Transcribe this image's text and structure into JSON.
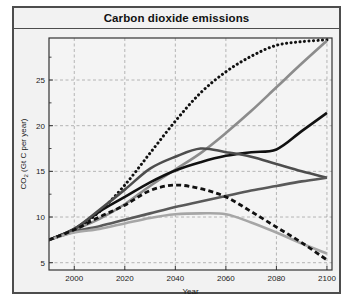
{
  "figure": {
    "title": "Carbon dioxide emissions",
    "background_color": "#f2f2f2",
    "border_color": "#4d4d4d"
  },
  "chart_data": {
    "type": "line",
    "title": "Carbon dioxide emissions",
    "xlabel": "Year",
    "ylabel": "CO2 (Gt C per year)",
    "ylabel_base": "CO",
    "ylabel_sub": "2",
    "ylabel_rest": " (Gt C per year)",
    "xlim": [
      1990,
      2102
    ],
    "ylim": [
      4.2,
      29.6
    ],
    "xticks": [
      2000,
      2020,
      2040,
      2060,
      2080,
      2100
    ],
    "xtick_labels": [
      "2000",
      "2020",
      "2040",
      "2060",
      "2080",
      "2100"
    ],
    "yticks": [
      5,
      10,
      15,
      20,
      25
    ],
    "ytick_labels": [
      "5",
      "10",
      "15",
      "20",
      "25"
    ],
    "yticks_minor": [
      7.5,
      12.5,
      17.5,
      22.5,
      27.5
    ],
    "grid": true,
    "grid_color": "#9a9a9a",
    "grid_style": "dashed",
    "legend": "none",
    "series": [
      {
        "name": "A1FI",
        "style": "dotted",
        "color": "#111111",
        "width": 2.6,
        "x": [
          1990,
          2000,
          2010,
          2020,
          2030,
          2040,
          2050,
          2060,
          2070,
          2080,
          2090,
          2100
        ],
        "values": [
          7.5,
          8.6,
          10.6,
          13.5,
          17.0,
          20.5,
          23.6,
          25.9,
          27.6,
          28.8,
          29.2,
          29.4
        ]
      },
      {
        "name": "A2",
        "style": "solid",
        "color": "#8c8c8c",
        "width": 2.6,
        "x": [
          1990,
          2000,
          2010,
          2020,
          2030,
          2040,
          2050,
          2060,
          2070,
          2080,
          2090,
          2100
        ],
        "values": [
          7.5,
          8.6,
          9.8,
          11.4,
          13.4,
          15.2,
          17.0,
          19.2,
          21.6,
          24.2,
          26.8,
          29.3
        ]
      },
      {
        "name": "A1B",
        "style": "solid",
        "color": "#111111",
        "width": 2.6,
        "x": [
          1990,
          2000,
          2010,
          2020,
          2030,
          2040,
          2050,
          2060,
          2070,
          2080,
          2090,
          2100
        ],
        "values": [
          7.5,
          8.7,
          10.6,
          12.2,
          13.8,
          15.1,
          16.0,
          16.7,
          17.1,
          17.4,
          19.4,
          21.4
        ]
      },
      {
        "name": "A1T",
        "style": "solid",
        "color": "#4d4d4d",
        "width": 2.6,
        "x": [
          1990,
          2000,
          2010,
          2020,
          2030,
          2040,
          2050,
          2060,
          2070,
          2080,
          2090,
          2100
        ],
        "values": [
          7.5,
          8.7,
          10.8,
          13.0,
          15.3,
          16.6,
          17.5,
          17.1,
          16.6,
          15.8,
          15.0,
          14.3
        ]
      },
      {
        "name": "B2",
        "style": "solid",
        "color": "#595959",
        "width": 2.6,
        "x": [
          1990,
          2000,
          2010,
          2020,
          2030,
          2040,
          2050,
          2060,
          2070,
          2080,
          2090,
          2100
        ],
        "values": [
          7.5,
          8.4,
          9.0,
          9.7,
          10.4,
          11.1,
          11.7,
          12.3,
          12.9,
          13.4,
          13.9,
          14.3
        ]
      },
      {
        "name": "B1",
        "style": "solid",
        "color": "#a6a6a6",
        "width": 2.6,
        "x": [
          1990,
          2000,
          2010,
          2020,
          2030,
          2040,
          2050,
          2060,
          2070,
          2080,
          2090,
          2100
        ],
        "values": [
          7.5,
          8.3,
          8.7,
          9.3,
          9.9,
          10.3,
          10.4,
          10.3,
          9.4,
          8.3,
          7.1,
          6.0
        ]
      },
      {
        "name": "B1 low",
        "style": "dashed",
        "color": "#111111",
        "width": 2.8,
        "x": [
          1990,
          2000,
          2010,
          2020,
          2030,
          2040,
          2050,
          2060,
          2070,
          2080,
          2090,
          2100
        ],
        "values": [
          7.5,
          8.6,
          10.0,
          11.3,
          12.9,
          13.5,
          13.1,
          12.2,
          10.6,
          8.9,
          7.2,
          5.3
        ]
      }
    ]
  }
}
